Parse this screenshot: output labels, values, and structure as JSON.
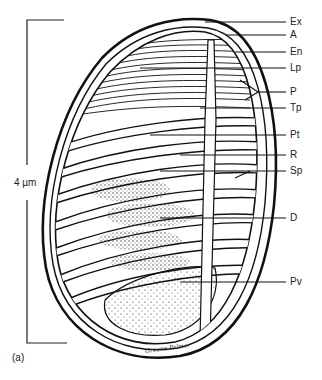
{
  "figure": {
    "panel_label": "(a)",
    "scale_bar": {
      "label": "4 µm"
    },
    "signature": "Greene Palmer",
    "labels": [
      {
        "id": "ex",
        "text": "Ex",
        "y": 22
      },
      {
        "id": "a",
        "text": "A",
        "y": 35
      },
      {
        "id": "en",
        "text": "En",
        "y": 52
      },
      {
        "id": "lp",
        "text": "Lp",
        "y": 68
      },
      {
        "id": "p",
        "text": "P",
        "y": 92
      },
      {
        "id": "tp",
        "text": "Tp",
        "y": 108
      },
      {
        "id": "pt",
        "text": "Pt",
        "y": 135
      },
      {
        "id": "r",
        "text": "R",
        "y": 155
      },
      {
        "id": "sp",
        "text": "Sp",
        "y": 171
      },
      {
        "id": "d",
        "text": "D",
        "y": 218
      },
      {
        "id": "pv",
        "text": "Pv",
        "y": 282
      }
    ]
  }
}
